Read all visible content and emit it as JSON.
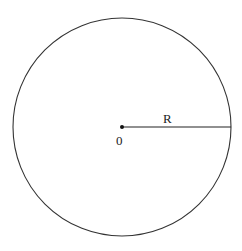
{
  "diagram": {
    "center_label": "0",
    "radius_label": "R",
    "shape": "circle",
    "stroke_color": "#333333"
  }
}
